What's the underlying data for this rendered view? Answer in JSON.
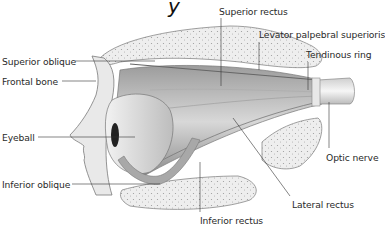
{
  "title_fragment": "y",
  "labels": {
    "superior_oblique": "Superior oblique",
    "frontal_bone": "Frontal bone",
    "eyeball": "Eyeball",
    "inferior_oblique": "Inferior oblique",
    "superior_rectus": "Superior rectus",
    "levator": "Levator palpebral superioris",
    "tendinous_ring": "Tendinous ring",
    "optic_nerve": "Optic nerve",
    "lateral_rectus": "Lateral rectus",
    "inferior_rectus": "Inferior rectus"
  },
  "colors": {
    "bone": "#e6e6e6",
    "muscle_dark": "#8a8a8a",
    "muscle_light": "#d4d4d4",
    "leader_line": "#333333",
    "text": "#2a2a2a"
  }
}
